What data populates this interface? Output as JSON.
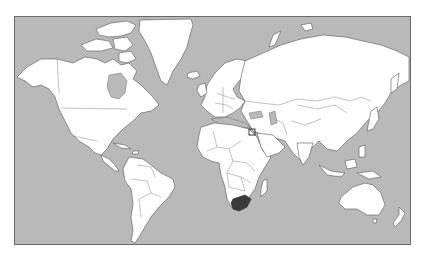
{
  "map": {
    "projection": "mercator",
    "title": "World map",
    "ocean_color": "#b9b9b9",
    "land_color": "#ffffff",
    "border_color": "#555555",
    "highlighted_region": {
      "name": "South Africa",
      "color": "#3a3a3a"
    },
    "marker": {
      "name": "Israel",
      "shape": "square-outline"
    },
    "continents": [
      "North America",
      "Greenland",
      "South America",
      "Europe",
      "Africa",
      "Asia",
      "Australia",
      "New Zealand",
      "Antarctica-absent"
    ]
  }
}
